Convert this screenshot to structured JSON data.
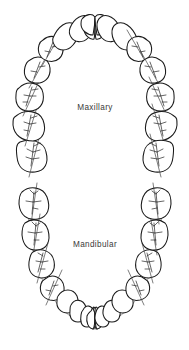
{
  "figure": {
    "background_color": "#ffffff",
    "ink_color": "#1a1a1a",
    "curve_color": "#8f8f8f",
    "label_color": "#3a3a3a",
    "width": 189,
    "height": 350
  },
  "arches": [
    {
      "id": "maxillary",
      "label": "Maxillary",
      "label_x": 95,
      "label_y": 110,
      "tooth_count": 16,
      "orientation": "upper-u-shape-opening-down"
    },
    {
      "id": "mandibular",
      "label": "Mandibular",
      "label_x": 95,
      "label_y": 247,
      "tooth_count": 16,
      "orientation": "lower-u-shape-opening-up"
    }
  ],
  "maxillary_teeth": [
    {
      "name": "third-molar-upper-left",
      "cx": 32,
      "cy": 155,
      "rx": 15,
      "ry": 17,
      "rot": -8,
      "type": "molar"
    },
    {
      "name": "second-molar-upper-left",
      "cx": 27,
      "cy": 124,
      "rx": 15,
      "ry": 16,
      "rot": -12,
      "type": "molar"
    },
    {
      "name": "first-molar-upper-left",
      "cx": 29,
      "cy": 96,
      "rx": 14,
      "ry": 15,
      "rot": -18,
      "type": "molar"
    },
    {
      "name": "second-premolar-upper-left",
      "cx": 37,
      "cy": 71,
      "rx": 12,
      "ry": 13,
      "rot": -26,
      "type": "premolar"
    },
    {
      "name": "first-premolar-upper-left",
      "cx": 49,
      "cy": 50,
      "rx": 12,
      "ry": 13,
      "rot": -36,
      "type": "premolar"
    },
    {
      "name": "canine-upper-left",
      "cx": 64,
      "cy": 33,
      "rx": 12,
      "ry": 13,
      "rot": -50,
      "type": "canine"
    },
    {
      "name": "lateral-incisor-upper-left",
      "cx": 80,
      "cy": 24,
      "rx": 11,
      "ry": 12,
      "rot": -68,
      "type": "incisor"
    },
    {
      "name": "central-incisor-upper-left",
      "cx": 95,
      "cy": 21,
      "rx": 12,
      "ry": 12,
      "rot": -85,
      "type": "incisor"
    },
    {
      "name": "central-incisor-upper-right",
      "cx": 110,
      "cy": 21,
      "rx": 12,
      "ry": 12,
      "rot": 85,
      "type": "incisor"
    },
    {
      "name": "lateral-incisor-upper-right",
      "cx": 125,
      "cy": 24,
      "rx": 11,
      "ry": 12,
      "rot": 68,
      "type": "incisor"
    },
    {
      "name": "canine-upper-right",
      "cx": 141,
      "cy": 33,
      "rx": 12,
      "ry": 13,
      "rot": 50,
      "type": "canine"
    },
    {
      "name": "first-premolar-upper-right",
      "cx": 156,
      "cy": 50,
      "rx": 12,
      "ry": 13,
      "rot": 36,
      "type": "premolar"
    },
    {
      "name": "second-premolar-upper-right",
      "cx": 168,
      "cy": 71,
      "rx": 12,
      "ry": 13,
      "rot": 26,
      "type": "premolar"
    },
    {
      "name": "first-molar-upper-right",
      "cx": 176,
      "cy": 96,
      "rx": 14,
      "ry": 15,
      "rot": 18,
      "type": "molar"
    },
    {
      "name": "second-molar-upper-right",
      "cx": 178,
      "cy": 124,
      "rx": 15,
      "ry": 16,
      "rot": 12,
      "type": "molar"
    },
    {
      "name": "third-molar-upper-right",
      "cx": 173,
      "cy": 155,
      "rx": 15,
      "ry": 17,
      "rot": 8,
      "type": "molar"
    }
  ],
  "mandibular_teeth": [
    {
      "name": "third-molar-lower-left",
      "cx": 34,
      "cy": 203,
      "rx": 15,
      "ry": 16,
      "rot": 6,
      "type": "molar"
    },
    {
      "name": "second-molar-lower-left",
      "cx": 36,
      "cy": 234,
      "rx": 14,
      "ry": 16,
      "rot": 10,
      "type": "molar"
    },
    {
      "name": "first-molar-lower-left",
      "cx": 42,
      "cy": 263,
      "rx": 13,
      "ry": 15,
      "rot": 18,
      "type": "molar"
    },
    {
      "name": "second-premolar-lower-left",
      "cx": 53,
      "cy": 288,
      "rx": 12,
      "ry": 13,
      "rot": 28,
      "type": "premolar"
    },
    {
      "name": "first-premolar-lower-left",
      "cx": 67,
      "cy": 305,
      "rx": 11,
      "ry": 12,
      "rot": 40,
      "type": "premolar"
    },
    {
      "name": "canine-lower-left",
      "cx": 79,
      "cy": 315,
      "rx": 10,
      "ry": 11,
      "rot": 55,
      "type": "canine"
    },
    {
      "name": "lateral-incisor-lower-left",
      "cx": 89,
      "cy": 320,
      "rx": 8,
      "ry": 10,
      "rot": 72,
      "type": "incisor"
    },
    {
      "name": "central-incisor-lower-left",
      "cx": 98,
      "cy": 322,
      "rx": 8,
      "ry": 10,
      "rot": 86,
      "type": "incisor"
    },
    {
      "name": "central-incisor-lower-right",
      "cx": 107,
      "cy": 322,
      "rx": 8,
      "ry": 10,
      "rot": -86,
      "type": "incisor"
    },
    {
      "name": "lateral-incisor-lower-right",
      "cx": 116,
      "cy": 320,
      "rx": 8,
      "ry": 10,
      "rot": -72,
      "type": "incisor"
    },
    {
      "name": "canine-lower-right",
      "cx": 126,
      "cy": 315,
      "rx": 10,
      "ry": 11,
      "rot": -55,
      "type": "canine"
    },
    {
      "name": "first-premolar-lower-right",
      "cx": 138,
      "cy": 305,
      "rx": 11,
      "ry": 12,
      "rot": -40,
      "type": "premolar"
    },
    {
      "name": "second-premolar-lower-right",
      "cx": 152,
      "cy": 288,
      "rx": 12,
      "ry": 13,
      "rot": -28,
      "type": "premolar"
    },
    {
      "name": "first-molar-lower-right",
      "cx": 163,
      "cy": 263,
      "rx": 13,
      "ry": 15,
      "rot": -18,
      "type": "molar"
    },
    {
      "name": "second-molar-lower-right",
      "cx": 169,
      "cy": 234,
      "rx": 14,
      "ry": 16,
      "rot": -10,
      "type": "molar"
    },
    {
      "name": "third-molar-lower-right",
      "cx": 171,
      "cy": 203,
      "rx": 15,
      "ry": 16,
      "rot": -6,
      "type": "molar"
    }
  ]
}
